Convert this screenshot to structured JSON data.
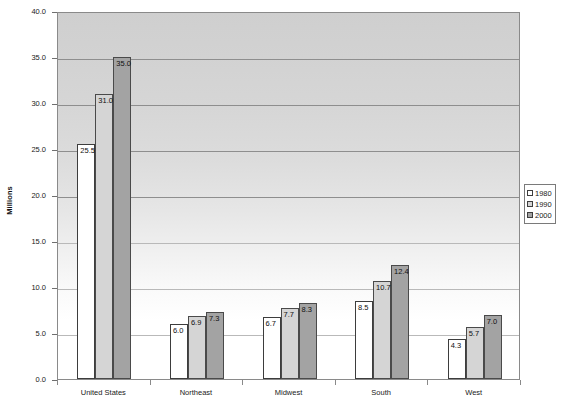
{
  "chart_data": {
    "type": "bar",
    "title": "",
    "subtitle": "",
    "xlabel": "",
    "ylabel": "Millions",
    "ylim": [
      0.0,
      40.0
    ],
    "ytick_step": 5.0,
    "ytick_labels": [
      "0.0",
      "5.0",
      "10.0",
      "15.0",
      "20.0",
      "25.0",
      "30.0",
      "35.0",
      "40.0"
    ],
    "ytick_values": [
      0.0,
      5.0,
      10.0,
      15.0,
      20.0,
      25.0,
      30.0,
      35.0,
      40.0
    ],
    "grid": true,
    "legend_position": "right",
    "categories": [
      "United States",
      "Northeast",
      "Midwest",
      "South",
      "West"
    ],
    "series": [
      {
        "name": "1980",
        "color": "#ffffff",
        "values": [
          25.5,
          6.0,
          6.7,
          8.5,
          4.3
        ]
      },
      {
        "name": "1990",
        "color": "#d5d5d5",
        "values": [
          31.0,
          6.9,
          7.7,
          10.7,
          5.7
        ]
      },
      {
        "name": "2000",
        "color": "#a3a3a3",
        "values": [
          35.0,
          7.3,
          8.3,
          12.4,
          7.0
        ]
      }
    ],
    "data_labels": [
      [
        "25.5",
        "31.0",
        "35.0"
      ],
      [
        "6.0",
        "6.9",
        "7.3"
      ],
      [
        "6.7",
        "7.7",
        "8.3"
      ],
      [
        "8.5",
        "10.7",
        "12.4"
      ],
      [
        "4.3",
        "5.7",
        "7.0"
      ]
    ]
  },
  "legend": {
    "items": [
      {
        "label": "1980"
      },
      {
        "label": "1990"
      },
      {
        "label": "2000"
      }
    ]
  }
}
